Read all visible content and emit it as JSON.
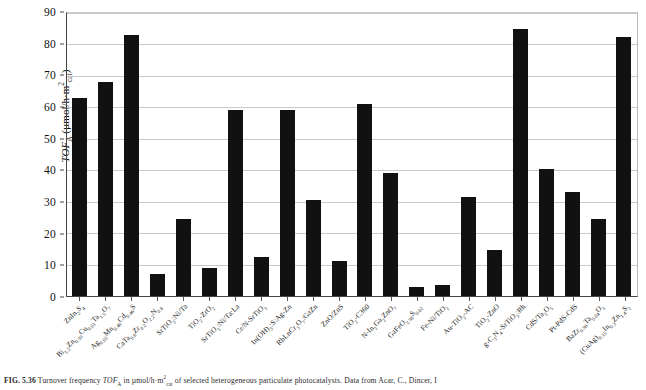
{
  "chart_data": {
    "type": "bar",
    "title": "",
    "xlabel": "",
    "ylabel": "TOF_A (µmol/h·m²_cat)",
    "ylim": [
      0,
      90
    ],
    "ytick_step": 10,
    "yticks": [
      "0",
      "10",
      "20",
      "30",
      "40",
      "50",
      "60",
      "70",
      "80",
      "90"
    ],
    "grid": true,
    "legend": "none",
    "bar_color": "#111111",
    "categories": [
      "ZnIn2S4",
      "Bi1.2Zn0.99Cu0.01Ta1.5O7",
      "Ag0.03Mn0.46Cd0.46S",
      "CaTa0.8Zr0.2O2.2N0.8",
      "SrTiO3:Ni/Ta",
      "TiO2-ZrO2",
      "SrTiO3:Ni/Ta:La",
      "Cr/N-SrTiO3",
      "In(OH)3:S:Ag-Zn",
      "RbLnCr3O7:GaZn",
      "ZnO/ZnS",
      "TiO2-C360",
      "N-In2Ga2ZnO7",
      "GaFeO2.98S0.02",
      "Fe-Ni/TiO2",
      "Au-TiO2-AC",
      "TiO2-ZnO",
      "g-C3N4-SrTiO3:Rh",
      "CdS/Ta2O5",
      "Pt-PdS-CdS",
      "BaZr0.96Ta0.04O3",
      "(CuAg)0.15In0.3Zn1.4S2"
    ],
    "categories_html": [
      "ZnIn<sub>2</sub>S<sub>4</sub>",
      "Bi<sub>1.2</sub>Zn<sub>0.99</sub>Cu<sub>0.01</sub>Ta<sub>1.5</sub>O<sub>7</sub>",
      "Ag<sub>0.03</sub>Mn<sub>0.46</sub>Cd<sub>0.46</sub>S",
      "CaTa<sub>0.8</sub>Zr<sub>0.2</sub>O<sub>2.2</sub>N<sub>0.8</sub>",
      "SrTiO<sub>3</sub>:Ni/Ta",
      "TiO<sub>2</sub>-ZrO<sub>2</sub>",
      "SrTiO<sub>3</sub>:Ni/Ta:La",
      "Cr/N-SrTiO<sub>3</sub>",
      "In(OH)<sub>3</sub>:S:Ag-Zn",
      "RbLnCr<sub>3</sub>O<sub>7</sub>:GaZn",
      "ZnO/ZnS",
      "TiO<sub>2</sub>-C360",
      "N-In<sub>2</sub>Ga<sub>2</sub>ZnO<sub>7</sub>",
      "GaFeO<sub>2.98</sub>S<sub>0.02</sub>",
      "Fe-Ni/TiO<sub>2</sub>",
      "Au-TiO<sub>2</sub>-AC",
      "TiO<sub>2</sub>-ZnO",
      "g-C<sub>3</sub>N<sub>4</sub>-SrTiO<sub>3</sub>:Rh",
      "CdS/Ta<sub>2</sub>O<sub>5</sub>",
      "Pt-PdS-CdS",
      "BaZr<sub>0.96</sub>Ta<sub>0.04</sub>O<sub>3</sub>",
      "(CuAg)<sub>0.15</sub>In<sub>0.3</sub>Zn<sub>1.4</sub>S<sub>2</sub>"
    ],
    "values": [
      63,
      68,
      83,
      7,
      24.5,
      9,
      59,
      12.5,
      59,
      30.5,
      11,
      61,
      39,
      3,
      3.5,
      31.5,
      14.5,
      85,
      40.5,
      33,
      24.5,
      82.5
    ]
  },
  "axis": {
    "y_title_html": "<span class=\"it\">TOF</span><sub>A</sub> (µmol/h·m<sup>2</sup><sub>cat</sub>)"
  },
  "caption": {
    "figure_number": "FIG. 5.36",
    "text_html": "Turnover frequency <span class=\"it\">TOF</span><sub>A</sub> in µmol/h·m<sup>2</sup><sub>cat</sub> of selected heterogeneous particulate photocatalysts. Data from Acar, C., Dincer, I"
  }
}
